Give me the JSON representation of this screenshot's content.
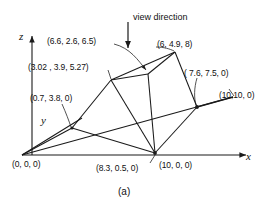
{
  "figure": {
    "caption": "(a)",
    "view_direction_label": "view direction",
    "axes": {
      "x_label": "x",
      "y_label": "y",
      "z_label": "z"
    },
    "line_color": "#1a1a1a",
    "text_color": "#111111",
    "background": "#ffffff",
    "vertex_labels": [
      {
        "id": "apex-upper",
        "text": "(6.6, 2.6, 6.5)"
      },
      {
        "id": "ridge-left",
        "text": "(3.02 , 3.9, 5.27)"
      },
      {
        "id": "peak-right",
        "text": "(6, 4.9, 8)"
      },
      {
        "id": "base-right-far",
        "text": "( 7.6, 7.5, 0)"
      },
      {
        "id": "corner-far",
        "text": "(10,10, 0)"
      },
      {
        "id": "base-left",
        "text": "(0.7, 3.8, 0)"
      },
      {
        "id": "origin",
        "text": "(0, 0, 0)"
      },
      {
        "id": "base-front",
        "text": "(8.3, 0.5, 0)"
      },
      {
        "id": "x-axis-point",
        "text": "(10, 0, 0)"
      }
    ]
  }
}
